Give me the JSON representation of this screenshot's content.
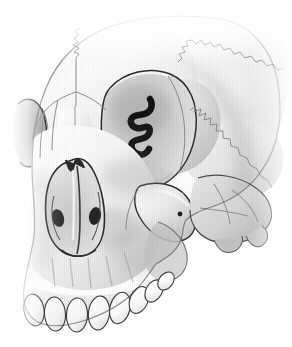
{
  "figure": {
    "title": "Human Skull — Anterolateral (Three-Quarter) View",
    "subject": "skull",
    "view": "oblique anterolateral",
    "medium": "grayscale airbrush and line illustration",
    "background_color": "#ffffff",
    "line_color": "#2b2b2b",
    "suture_color": "#8c8c8c",
    "bone_light": "#fdfdfd",
    "bone_mid": "#d8d8d8",
    "bone_shadow": "#a9a9a9",
    "cavity_dark": "#1c1c1c",
    "width": 292,
    "height": 347
  },
  "regions": [
    {
      "id": "frontal-bone",
      "label": "Frontal bone",
      "description": "Broad forehead plate fading to white at superior margin"
    },
    {
      "id": "parietal-bone",
      "label": "Parietal bone",
      "description": "Upper right cranial vault separated by serrated coronal suture"
    },
    {
      "id": "temporal-bone",
      "label": "Temporal bone",
      "description": "Squamous portion below the squamosal suture on the right"
    },
    {
      "id": "greater-wing-sphenoid",
      "label": "Greater wing of sphenoid",
      "description": "Shaded plate forming the posterior orbital wall and temporal fossa floor"
    },
    {
      "id": "right-orbit",
      "label": "Right orbit",
      "description": "Large oval orbital cavity with recessed shading"
    },
    {
      "id": "left-orbit-partial",
      "label": "Left orbit (foreshortened)",
      "description": "Partial orbital rim visible at the far left edge"
    },
    {
      "id": "orbital-fissures",
      "label": "Superior and inferior orbital fissures",
      "description": "Dark hooked slit deep within the right orbit"
    },
    {
      "id": "nasal-bones",
      "label": "Nasal bones",
      "description": "Paired bones along the midline bridge with internasal suture"
    },
    {
      "id": "piriform-aperture",
      "label": "Piriform (nasal) aperture",
      "description": "Pear-shaped nasal opening with dark conchal recesses"
    },
    {
      "id": "nasal-septum",
      "label": "Nasal septum / vomer",
      "description": "Vertical midline ridge dividing the nasal cavity"
    },
    {
      "id": "inferior-concha",
      "label": "Inferior nasal conchae",
      "description": "Dark curled shelves inside each side of the nasal cavity"
    },
    {
      "id": "zygomatic-bone",
      "label": "Zygomatic bone",
      "description": "Cheek prominence with zygomaticofacial foramen"
    },
    {
      "id": "zygomaticofacial-foramen",
      "label": "Zygomaticofacial foramen",
      "description": "Small dark dot on the lateral cheek surface"
    },
    {
      "id": "maxilla",
      "label": "Maxilla",
      "description": "Upper jaw body with canine fossa and alveolar juga"
    },
    {
      "id": "alveolar-process",
      "label": "Alveolar process",
      "description": "Tooth-bearing ridge with vertical root eminences"
    },
    {
      "id": "pterygoid-region",
      "label": "Pterygoid / infratemporal region",
      "description": "Shaded recess posterior to the maxilla"
    },
    {
      "id": "mastoid-region",
      "label": "Mastoid / petrous region",
      "description": "Lower right shaded processes below the temporal squama"
    }
  ],
  "sutures": [
    {
      "id": "coronal-suture",
      "label": "Coronal suture",
      "style": "serrated"
    },
    {
      "id": "squamosal-suture",
      "label": "Squamosal suture",
      "style": "serrated"
    },
    {
      "id": "sphenofrontal-suture",
      "label": "Sphenofrontal suture",
      "style": "smooth"
    },
    {
      "id": "frontonasal-suture",
      "label": "Frontonasal suture",
      "style": "serrated"
    },
    {
      "id": "internasal-suture",
      "label": "Internasal suture",
      "style": "fine"
    },
    {
      "id": "frontomaxillary-suture",
      "label": "Frontomaxillary suture",
      "style": "fine"
    },
    {
      "id": "zygomaticomaxillary-suture",
      "label": "Zygomaticomaxillary suture",
      "style": "fine"
    },
    {
      "id": "occipitomastoid-suture",
      "label": "Occipitomastoid suture",
      "style": "fine"
    }
  ],
  "teeth": {
    "arch_label": "Maxillary dental arch",
    "count": 8,
    "items": [
      {
        "id": "tooth-1",
        "label": "Central incisor (left)"
      },
      {
        "id": "tooth-2",
        "label": "Central incisor (right)"
      },
      {
        "id": "tooth-3",
        "label": "Lateral incisor"
      },
      {
        "id": "tooth-4",
        "label": "Canine"
      },
      {
        "id": "tooth-5",
        "label": "First premolar"
      },
      {
        "id": "tooth-6",
        "label": "Second premolar"
      },
      {
        "id": "tooth-7",
        "label": "First molar"
      },
      {
        "id": "tooth-8",
        "label": "Second molar"
      }
    ]
  }
}
